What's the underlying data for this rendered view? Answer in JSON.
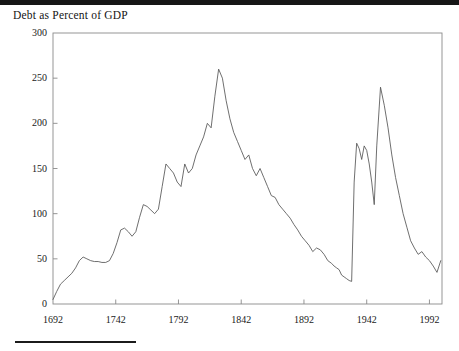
{
  "figure": {
    "title": "Debt as Percent of GDP",
    "line_color": "#555555",
    "axis_color": "#8a8a8a",
    "background": "#ffffff",
    "top_band_color": "#161616",
    "rule_color": "#1b1b1b"
  },
  "chart_data": {
    "type": "line",
    "title": "Debt as Percent of GDP",
    "xlabel": "",
    "ylabel": "",
    "xlim": [
      1692,
      2002
    ],
    "ylim": [
      0,
      300
    ],
    "xticks": [
      1692,
      1742,
      1792,
      1842,
      1892,
      1942,
      1992
    ],
    "xtick_labels": [
      "1692",
      "1742",
      "1792",
      "1842",
      "1892",
      "1942",
      "1992"
    ],
    "yticks": [
      0,
      50,
      100,
      150,
      200,
      250,
      300
    ],
    "ytick_labels": [
      "0",
      "50",
      "100",
      "150",
      "200",
      "250",
      "300"
    ],
    "grid": false,
    "legend": null,
    "series": [
      {
        "name": "Debt as Percent of GDP",
        "x": [
          1692,
          1695,
          1698,
          1701,
          1704,
          1707,
          1710,
          1713,
          1716,
          1719,
          1722,
          1725,
          1728,
          1731,
          1734,
          1737,
          1740,
          1743,
          1746,
          1749,
          1752,
          1755,
          1758,
          1761,
          1764,
          1767,
          1770,
          1773,
          1776,
          1779,
          1782,
          1785,
          1788,
          1791,
          1794,
          1797,
          1800,
          1803,
          1806,
          1809,
          1812,
          1815,
          1818,
          1821,
          1824,
          1827,
          1830,
          1833,
          1836,
          1839,
          1842,
          1845,
          1848,
          1851,
          1854,
          1857,
          1860,
          1863,
          1866,
          1869,
          1872,
          1875,
          1878,
          1881,
          1884,
          1887,
          1890,
          1893,
          1896,
          1899,
          1902,
          1905,
          1908,
          1911,
          1914,
          1916,
          1918,
          1920,
          1922,
          1924,
          1926,
          1928,
          1930,
          1932,
          1934,
          1936,
          1938,
          1940,
          1942,
          1944,
          1946,
          1948,
          1950,
          1953,
          1956,
          1959,
          1962,
          1965,
          1968,
          1971,
          1974,
          1977,
          1980,
          1983,
          1986,
          1989,
          1992,
          1995,
          1998,
          2001
        ],
        "y": [
          5,
          14,
          22,
          26,
          30,
          34,
          40,
          48,
          52,
          50,
          48,
          47,
          47,
          46,
          46,
          48,
          56,
          68,
          82,
          84,
          80,
          75,
          80,
          96,
          110,
          108,
          104,
          100,
          105,
          130,
          155,
          150,
          145,
          135,
          130,
          155,
          145,
          150,
          165,
          175,
          185,
          200,
          195,
          230,
          260,
          250,
          225,
          205,
          190,
          180,
          170,
          160,
          165,
          150,
          142,
          150,
          140,
          130,
          120,
          118,
          110,
          105,
          100,
          95,
          88,
          82,
          75,
          70,
          65,
          58,
          62,
          60,
          55,
          48,
          45,
          42,
          40,
          38,
          32,
          30,
          28,
          26,
          25,
          135,
          178,
          172,
          160,
          175,
          170,
          155,
          135,
          110,
          175,
          240,
          220,
          195,
          165,
          140,
          120,
          100,
          85,
          70,
          62,
          55,
          58,
          52,
          48,
          42,
          35,
          48
        ]
      }
    ],
    "annotations": [
      {
        "label": "Napoleonic Wars peak",
        "year": 1824,
        "value": 260
      },
      {
        "label": "WWI plateau",
        "year": 1922,
        "value": 178
      },
      {
        "label": "WWII peak",
        "year": 1946,
        "value": 240
      },
      {
        "label": "Pre-WWI trough",
        "year": 1913,
        "value": 25
      }
    ]
  }
}
